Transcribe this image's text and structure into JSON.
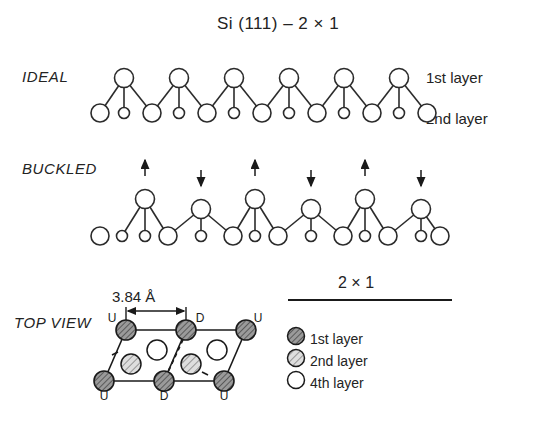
{
  "figure": {
    "title": "Si (111) – 2 × 1",
    "panels": {
      "ideal": {
        "label": "IDEAL"
      },
      "buckled": {
        "label": "BUCKLED"
      },
      "top_view": {
        "label": "TOP VIEW"
      }
    },
    "side_labels": {
      "first_layer": "1st layer",
      "second_layer": "2nd layer"
    },
    "dimension": {
      "value": "3.84 Å"
    },
    "legend": {
      "title": "2 × 1",
      "items": [
        {
          "label": "1st layer",
          "swatch": "dark-hatched-circle",
          "color": "#8a8a8a"
        },
        {
          "label": "2nd layer",
          "swatch": "light-hatched-circle",
          "color": "#c9c9c9"
        },
        {
          "label": "4th layer",
          "swatch": "open-circle",
          "color": "#ffffff"
        }
      ]
    },
    "top_view_atoms": {
      "top_row_labels": [
        "U",
        "D",
        "U"
      ],
      "bottom_row_labels": [
        "U",
        "D",
        "U"
      ]
    },
    "buckled_arrows": [
      "up",
      "down",
      "up",
      "down",
      "up",
      "down"
    ],
    "colors": {
      "stroke": "#2b2b2b",
      "background": "#ffffff",
      "first_layer_fill": "#8f8f8f",
      "second_layer_fill": "#cfcfcf",
      "fourth_layer_fill": "#ffffff"
    }
  }
}
